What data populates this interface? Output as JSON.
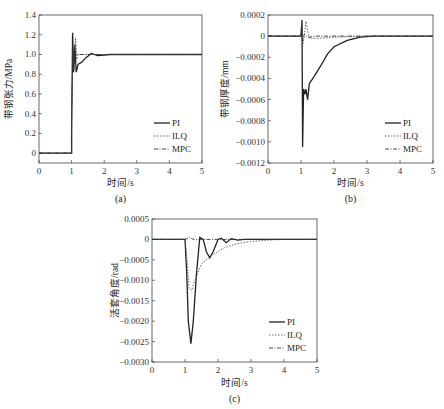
{
  "figure": {
    "panels": [
      "(a)",
      "(b)",
      "(c)"
    ]
  },
  "legend": {
    "items": [
      {
        "name": "PI",
        "style": "solid",
        "color": "#222222"
      },
      {
        "name": "ILQ",
        "style": "dotted",
        "color": "#555555"
      },
      {
        "name": "MPC",
        "style": "dash-dot",
        "color": "#333333"
      }
    ]
  },
  "chart_data": [
    {
      "type": "line",
      "caption": "(a)",
      "title": "",
      "xlabel": "时间/s",
      "ylabel": "带钢张力/MPa",
      "xlim": [
        0,
        5
      ],
      "ylim": [
        -0.1,
        1.4
      ],
      "xticks": [
        "0",
        "1",
        "2",
        "3",
        "4",
        "5"
      ],
      "yticks": [
        "0",
        "0.2",
        "0.4",
        "0.6",
        "0.8",
        "1.0",
        "1.2",
        "1.4"
      ],
      "grid": false,
      "legend_position": "lower right",
      "series": [
        {
          "name": "PI",
          "x": [
            0,
            1.0,
            1.0,
            1.03,
            1.06,
            1.1,
            1.14,
            1.2,
            1.3,
            1.45,
            1.6,
            1.8,
            2.2,
            5.0
          ],
          "y": [
            0,
            0,
            0.2,
            1.22,
            0.82,
            1.1,
            0.82,
            0.9,
            0.92,
            0.97,
            1.01,
            0.99,
            1.0,
            1.0
          ]
        },
        {
          "name": "ILQ",
          "x": [
            0,
            1.0,
            1.0,
            1.04,
            1.08,
            1.12,
            1.16,
            1.2,
            1.3,
            5.0
          ],
          "y": [
            0,
            0,
            0.3,
            1.02,
            0.85,
            1.17,
            0.95,
            1.0,
            1.0,
            1.0
          ]
        },
        {
          "name": "MPC",
          "x": [
            0,
            1.0,
            1.0,
            1.04,
            1.08,
            1.12,
            1.2,
            5.0
          ],
          "y": [
            0,
            0,
            0.4,
            1.05,
            0.9,
            1.02,
            1.0,
            1.0
          ]
        }
      ]
    },
    {
      "type": "line",
      "caption": "(b)",
      "title": "",
      "xlabel": "时间/s",
      "ylabel": "带钢厚度/mm",
      "xlim": [
        0,
        5
      ],
      "ylim": [
        -0.0012,
        0.0002
      ],
      "xticks": [
        "0",
        "1",
        "2",
        "3",
        "4",
        "5"
      ],
      "yticks": [
        "-0.0012",
        "-0.0010",
        "-0.0008",
        "-0.0006",
        "-0.0004",
        "-0.0002",
        "0",
        "0.0002"
      ],
      "grid": false,
      "legend_position": "lower right",
      "series": [
        {
          "name": "PI",
          "x": [
            0,
            1.0,
            1.03,
            1.05,
            1.08,
            1.12,
            1.15,
            1.2,
            1.25,
            1.4,
            1.6,
            1.8,
            2.0,
            2.4,
            2.8,
            3.2,
            5.0
          ],
          "y": [
            0,
            0,
            0.00015,
            -0.00105,
            -0.0005,
            -0.00055,
            -0.0005,
            -0.0006,
            -0.00045,
            -0.00038,
            -0.00028,
            -0.00017,
            -0.0001,
            -4e-05,
            -1e-05,
            0,
            0
          ]
        },
        {
          "name": "ILQ",
          "x": [
            0,
            1.0,
            1.02,
            1.05,
            1.1,
            1.15,
            1.2,
            1.25,
            1.3,
            1.5,
            2.0,
            3.0,
            5.0
          ],
          "y": [
            0,
            0,
            0.00015,
            -0.0001,
            0.0,
            0.00014,
            5e-05,
            -2e-05,
            -2e-05,
            -2e-05,
            -1e-05,
            0,
            0
          ]
        },
        {
          "name": "MPC",
          "x": [
            0,
            1.0,
            1.02,
            1.05,
            1.1,
            1.2,
            1.5,
            5.0
          ],
          "y": [
            0,
            0,
            0.0001,
            -5e-05,
            2e-05,
            -1e-05,
            0,
            0
          ]
        }
      ]
    },
    {
      "type": "line",
      "caption": "(c)",
      "title": "",
      "xlabel": "时间/s",
      "ylabel": "活套角度/rad",
      "xlim": [
        0,
        5
      ],
      "ylim": [
        -0.003,
        0.0005
      ],
      "xticks": [
        "0",
        "1",
        "2",
        "3",
        "4",
        "5"
      ],
      "yticks": [
        "-0.0030",
        "-0.0025",
        "-0.0020",
        "-0.0015",
        "-0.0010",
        "-0.0005",
        "0",
        "0.0005"
      ],
      "grid": false,
      "legend_position": "lower right",
      "series": [
        {
          "name": "PI",
          "x": [
            0,
            1.0,
            1.05,
            1.1,
            1.18,
            1.25,
            1.35,
            1.45,
            1.55,
            1.65,
            1.75,
            1.85,
            2.0,
            2.1,
            2.25,
            2.4,
            2.6,
            2.8,
            5.0
          ],
          "y": [
            0,
            0,
            -0.0008,
            -0.002,
            -0.00255,
            -0.002,
            -0.0008,
            5e-05,
            0.0,
            -0.0003,
            -0.00045,
            -0.0003,
            0.0,
            3e-05,
            -8e-05,
            2e-05,
            -2e-05,
            0,
            0
          ]
        },
        {
          "name": "ILQ",
          "x": [
            0,
            1.0,
            1.05,
            1.12,
            1.2,
            1.3,
            1.5,
            1.8,
            2.2,
            2.6,
            3.0,
            3.5,
            4.0,
            5.0
          ],
          "y": [
            0,
            0,
            -0.0004,
            -0.0012,
            -0.00125,
            -0.001,
            -0.0006,
            -0.0004,
            -0.0002,
            -0.0001,
            -5e-05,
            -2e-05,
            0,
            0
          ]
        },
        {
          "name": "MPC",
          "x": [
            0,
            1.0,
            1.1,
            1.15,
            1.2,
            1.3,
            1.5,
            5.0
          ],
          "y": [
            0,
            0,
            3e-05,
            6e-05,
            2e-05,
            -1e-05,
            0,
            0
          ]
        }
      ]
    }
  ]
}
